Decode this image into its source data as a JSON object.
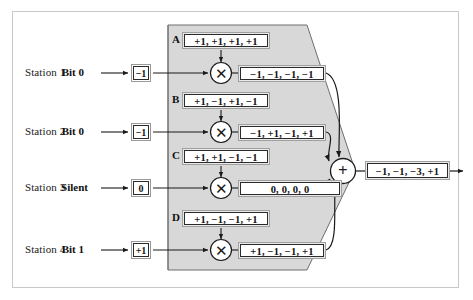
{
  "figure": {
    "background_color": "#ffffff",
    "frame_color": "#c9c9c9",
    "funnel_fill": "#d8d8d8",
    "funnel_stroke": "#6e6e6e",
    "line_color": "#1a1a1a"
  },
  "stations": [
    {
      "station_label": "Station 1",
      "bit_label": "Bit 0",
      "bit_value": "−1",
      "chip_letter": "A",
      "chip_sequence": "+1, +1, +1, +1",
      "signal": "−1, −1, −1, −1",
      "multiplier_glyph": "✕"
    },
    {
      "station_label": "Station 2",
      "bit_label": "Bit 0",
      "bit_value": "−1",
      "chip_letter": "B",
      "chip_sequence": "+1, −1, +1, −1",
      "signal": "−1, +1, −1, +1",
      "multiplier_glyph": "✕"
    },
    {
      "station_label": "Station 3",
      "bit_label": "Silent",
      "bit_value": "0",
      "chip_letter": "C",
      "chip_sequence": "+1, +1, −1, −1",
      "signal": "0, 0, 0, 0",
      "multiplier_glyph": "✕"
    },
    {
      "station_label": "Station 4",
      "bit_label": "Bit 1",
      "bit_value": "+1",
      "chip_letter": "D",
      "chip_sequence": "+1, −1, −1, +1",
      "signal": "+1, −1, −1, +1",
      "multiplier_glyph": "✕"
    }
  ],
  "adder": {
    "glyph": "+",
    "name": "summation-node"
  },
  "output": {
    "value": "−1, −1, −3, +1"
  },
  "icons": {
    "multiply_icon": "multiply-icon",
    "sum_icon": "sum-icon",
    "arrow_icon": "arrow-right-icon"
  }
}
